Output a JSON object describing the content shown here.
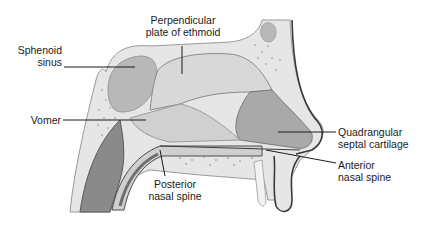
{
  "diagram": {
    "labels": {
      "sphenoid_sinus": [
        "Sphenoid",
        "sinus"
      ],
      "perpendicular_plate": [
        "Perpendicular",
        "plate of ethmoid"
      ],
      "vomer": [
        "Vomer"
      ],
      "quadrangular_cartilage": [
        "Quadrangular",
        "septal cartilage"
      ],
      "anterior_nasal_spine": [
        "Anterior",
        "nasal spine"
      ],
      "posterior_nasal_spine": [
        "Posterior",
        "nasal spine"
      ]
    },
    "colors": {
      "bone_light": "#e6e6e6",
      "bone_mid": "#d2d2d2",
      "sinus": "#b8b8b8",
      "cartilage": "#a9a9a9",
      "soft_tissue_dark": "#7d7d7d",
      "outline": "#3a3a3a",
      "leader_line": "#1a1a1a"
    }
  }
}
